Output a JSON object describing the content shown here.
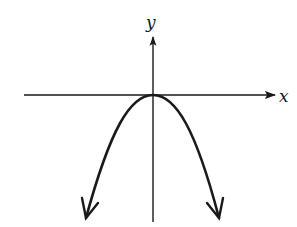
{
  "diagram": {
    "type": "function-graph",
    "axes": {
      "x_label": "x",
      "y_label": "y"
    },
    "curve": {
      "shape": "parabola",
      "opens": "down",
      "vertex": [
        0,
        0
      ],
      "ends_with_arrows": true
    },
    "colors": {
      "ink": "#1a1a1a",
      "background": "#ffffff"
    }
  }
}
